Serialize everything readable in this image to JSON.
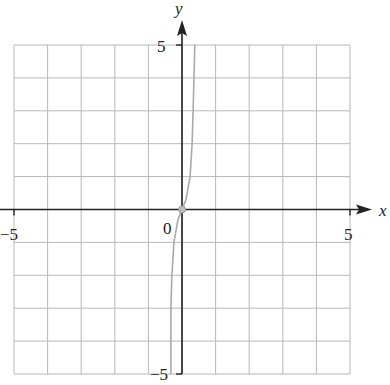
{
  "chart_data": {
    "type": "line",
    "title": "",
    "xlabel": "x",
    "ylabel": "y",
    "xlim": [
      -5,
      5
    ],
    "ylim": [
      -5,
      5
    ],
    "grid": true,
    "grid_step": 1,
    "tick_labels": {
      "x": [
        "-5",
        "5"
      ],
      "y": [
        "5",
        "-5"
      ],
      "origin": "0"
    },
    "series": [
      {
        "name": "curve",
        "color": "#aaaaaa",
        "points": [
          [
            -0.33,
            -5
          ],
          [
            -0.33,
            -3
          ],
          [
            -0.3,
            -2
          ],
          [
            -0.24,
            -1
          ],
          [
            -0.12,
            -0.3
          ],
          [
            0,
            0
          ],
          [
            0.12,
            0.3
          ],
          [
            0.24,
            1
          ],
          [
            0.3,
            2
          ],
          [
            0.33,
            3
          ],
          [
            0.38,
            5
          ]
        ]
      }
    ],
    "marked_points": [
      [
        0,
        0
      ]
    ]
  },
  "labels": {
    "x_axis": "x",
    "y_axis": "y",
    "x_min": "−5",
    "x_max": "5",
    "y_max": "5",
    "y_min": "−5",
    "origin": "0"
  }
}
